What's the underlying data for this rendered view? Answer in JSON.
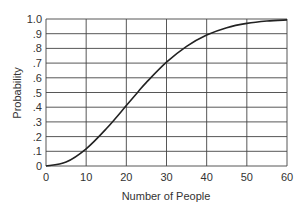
{
  "chart_data": {
    "type": "line",
    "title": "",
    "xlabel": "Number of People",
    "ylabel": "Probability",
    "xlim": [
      0,
      60
    ],
    "ylim": [
      0,
      1.0
    ],
    "grid": true,
    "x_ticks": [
      "0",
      "10",
      "20",
      "30",
      "40",
      "50",
      "60"
    ],
    "y_ticks": [
      "0",
      ".1",
      ".2",
      ".3",
      ".4",
      ".5",
      ".6",
      ".7",
      ".8",
      ".9",
      "1.0"
    ],
    "series": [
      {
        "name": "Probability of shared birthday",
        "x": [
          0,
          5,
          10,
          15,
          20,
          23,
          25,
          30,
          35,
          40,
          45,
          50,
          55,
          60
        ],
        "values": [
          0,
          0.027,
          0.117,
          0.253,
          0.411,
          0.507,
          0.569,
          0.706,
          0.814,
          0.891,
          0.941,
          0.97,
          0.986,
          0.994
        ]
      }
    ]
  }
}
